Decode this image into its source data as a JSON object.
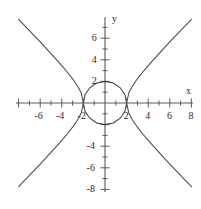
{
  "figure": {
    "title": "",
    "background_color": "#ffffff",
    "stroke_color": "#4a4a4a",
    "axis_color": "#5a5a5a",
    "width_px": 201,
    "height_px": 209
  },
  "axes": {
    "x_name": "x",
    "y_name": "y",
    "origin_px": {
      "x": 105,
      "y": 103
    },
    "unit_px": 10.8,
    "x_range": [
      -8,
      8
    ],
    "y_range": [
      -8,
      8
    ],
    "x_tick_labels": [
      {
        "value": -6,
        "text": "-6"
      },
      {
        "value": -4,
        "text": "-4"
      },
      {
        "value": -2,
        "text": "-2"
      },
      {
        "value": 2,
        "text": "2"
      },
      {
        "value": 4,
        "text": "4"
      },
      {
        "value": 6,
        "text": "6"
      },
      {
        "value": 8,
        "text": "8"
      }
    ],
    "y_tick_labels": [
      {
        "value": 6,
        "text": "6"
      },
      {
        "value": 4,
        "text": "4"
      },
      {
        "value": 2,
        "text": "2"
      },
      {
        "value": -4,
        "text": "-4"
      },
      {
        "value": -6,
        "text": "-6"
      },
      {
        "value": -8,
        "text": "-8"
      }
    ],
    "x_ticks_all": [
      -8,
      -7,
      -6,
      -5,
      -4,
      -3,
      -2,
      -1,
      1,
      2,
      3,
      4,
      5,
      6,
      7,
      8
    ],
    "y_ticks_all": [
      -8,
      -7,
      -6,
      -5,
      -4,
      -3,
      -2,
      -1,
      1,
      2,
      3,
      4,
      5,
      6,
      7
    ],
    "grid": false,
    "legend": "none"
  },
  "chart_data": {
    "type": "line",
    "title": "",
    "xlabel": "x",
    "ylabel": "y",
    "xlim": [
      -8,
      8
    ],
    "ylim": [
      -8,
      8
    ],
    "grid": false,
    "legend_position": "none",
    "series": [
      {
        "name": "circle",
        "equation": "x^2 + y^2 = 4",
        "shape": "circle",
        "center": [
          0,
          0
        ],
        "radius": 2,
        "points": [
          [
            2,
            0
          ],
          [
            1.85,
            0.77
          ],
          [
            1.41,
            1.41
          ],
          [
            0.77,
            1.85
          ],
          [
            0,
            2
          ],
          [
            -0.77,
            1.85
          ],
          [
            -1.41,
            1.41
          ],
          [
            -1.85,
            0.77
          ],
          [
            -2,
            0
          ],
          [
            -1.85,
            -0.77
          ],
          [
            -1.41,
            -1.41
          ],
          [
            -0.77,
            -1.85
          ],
          [
            0,
            -2
          ],
          [
            0.77,
            -1.85
          ],
          [
            1.41,
            -1.41
          ],
          [
            1.85,
            -0.77
          ],
          [
            2,
            0
          ]
        ]
      },
      {
        "name": "hyperbola-upper-right",
        "equation": "y = sqrt(x^2 - 4), x >= 2",
        "points": [
          [
            2,
            0
          ],
          [
            2.2,
            0.92
          ],
          [
            2.5,
            1.5
          ],
          [
            3,
            2.24
          ],
          [
            3.5,
            2.87
          ],
          [
            4,
            3.46
          ],
          [
            5,
            4.58
          ],
          [
            6,
            5.66
          ],
          [
            7,
            6.71
          ],
          [
            8,
            7.75
          ]
        ]
      },
      {
        "name": "hyperbola-upper-left",
        "equation": "y = sqrt(x^2 - 4), x <= -2",
        "points": [
          [
            -2,
            0
          ],
          [
            -2.2,
            0.92
          ],
          [
            -2.5,
            1.5
          ],
          [
            -3,
            2.24
          ],
          [
            -3.5,
            2.87
          ],
          [
            -4,
            3.46
          ],
          [
            -5,
            4.58
          ],
          [
            -6,
            5.66
          ],
          [
            -7,
            6.71
          ],
          [
            -8,
            7.75
          ]
        ]
      },
      {
        "name": "hyperbola-lower-right",
        "equation": "y = -sqrt(x^2 - 4), x >= 2",
        "points": [
          [
            2,
            0
          ],
          [
            2.2,
            -0.92
          ],
          [
            2.5,
            -1.5
          ],
          [
            3,
            -2.24
          ],
          [
            3.5,
            -2.87
          ],
          [
            4,
            -3.46
          ],
          [
            5,
            -4.58
          ],
          [
            6,
            -5.66
          ],
          [
            7,
            -6.71
          ],
          [
            8,
            -7.75
          ]
        ]
      },
      {
        "name": "hyperbola-lower-left",
        "equation": "y = -sqrt(x^2 - 4), x <= -2",
        "points": [
          [
            -2,
            0
          ],
          [
            -2.2,
            -0.92
          ],
          [
            -2.5,
            -1.5
          ],
          [
            -3,
            -2.24
          ],
          [
            -3.5,
            -2.87
          ],
          [
            -4,
            -3.46
          ],
          [
            -5,
            -4.58
          ],
          [
            -6,
            -5.66
          ],
          [
            -7,
            -6.71
          ],
          [
            -8,
            -7.75
          ]
        ]
      }
    ],
    "intersections": [
      [
        2,
        0
      ],
      [
        -2,
        0
      ]
    ],
    "annotations": []
  }
}
